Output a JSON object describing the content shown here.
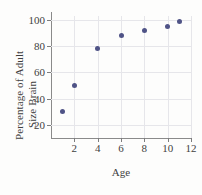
{
  "chart_data": {
    "type": "scatter",
    "title": "",
    "xlabel": "Age",
    "ylabel": "Percentage of Adult Size Brain",
    "ylabel_line1": "Percentage of Adult",
    "ylabel_line2": "Size Brain",
    "x": [
      1,
      2,
      4,
      6,
      8,
      10,
      11
    ],
    "values": [
      30,
      50,
      78,
      88,
      92,
      95,
      99
    ],
    "points": [
      {
        "x": 1,
        "y": 30
      },
      {
        "x": 2,
        "y": 50
      },
      {
        "x": 4,
        "y": 78
      },
      {
        "x": 6,
        "y": 88
      },
      {
        "x": 8,
        "y": 92
      },
      {
        "x": 10,
        "y": 95
      },
      {
        "x": 11,
        "y": 99
      }
    ],
    "xlim": [
      0,
      12
    ],
    "ylim": [
      10,
      103
    ],
    "xticks": [
      2,
      4,
      6,
      8,
      10,
      12
    ],
    "yticks": [
      20,
      40,
      60,
      80,
      100
    ],
    "grid": true,
    "legend": null,
    "marker_color": "#4f5386",
    "grid_color": "#e6e6ea",
    "axis_color": "#8a8a8a",
    "background_color": "#fdfdfc"
  }
}
